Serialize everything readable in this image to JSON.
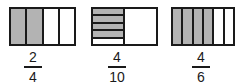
{
  "figures": [
    {
      "type": "vertical-strips",
      "parts": 4,
      "shaded": 2,
      "label": {
        "numerator": "2",
        "denominator": "4"
      }
    },
    {
      "type": "half-with-horizontal-strips",
      "parts_in_left_half": 5,
      "shaded": 4,
      "label": {
        "numerator": "4",
        "denominator": "10"
      }
    },
    {
      "type": "vertical-strips",
      "parts": 6,
      "shaded": 4,
      "label": {
        "numerator": "4",
        "denominator": "6"
      }
    }
  ],
  "colors": {
    "shade": "#b3b3b3",
    "outline": "#1a1a1a",
    "background": "#ffffff"
  }
}
